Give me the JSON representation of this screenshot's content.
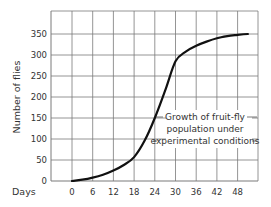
{
  "chart_data": {
    "type": "line",
    "title": "",
    "xlabel": "Days",
    "ylabel": "Number of flies",
    "x_ticks": [
      "0",
      "6",
      "12",
      "18",
      "24",
      "30",
      "36",
      "42",
      "48"
    ],
    "y_ticks": [
      "0",
      "50",
      "100",
      "150",
      "200",
      "250",
      "300",
      "350"
    ],
    "xlim": [
      -3,
      51
    ],
    "ylim": [
      0,
      385
    ],
    "grid": true,
    "legend": null,
    "annotation": [
      "Growth of fruit-fly",
      "population under",
      "experimental conditions"
    ],
    "series": [
      {
        "name": "Growth of fruit-fly population under experimental conditions",
        "x": [
          0,
          3,
          6,
          9,
          12,
          15,
          18,
          21,
          24,
          27,
          30,
          33,
          36,
          39,
          42,
          45,
          48,
          51
        ],
        "y": [
          0,
          3,
          8,
          15,
          25,
          38,
          57,
          95,
          150,
          215,
          285,
          308,
          322,
          332,
          340,
          345,
          348,
          350
        ]
      }
    ]
  },
  "labels": {
    "xlabel": "Days",
    "ylabel": "Number of flies",
    "annotation_line1": "Growth of fruit-fly",
    "annotation_line2": "population under",
    "annotation_line3": "experimental conditions"
  },
  "colors": {
    "grid": "#7a7a7a",
    "curve": "#111111",
    "text": "#333333"
  }
}
